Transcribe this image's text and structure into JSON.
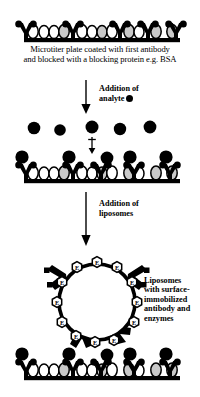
{
  "figure": {
    "panels": [
      {
        "id": "panel-1",
        "name": "antibody-coated-plate",
        "caption_line1": "Microtiter plate coated with first antibody",
        "caption_line2": "and blocked with a blocking protein e.g. BSA",
        "antibody_count": 5,
        "bsa_count": 12
      },
      {
        "id": "panel-2",
        "name": "analyte-bound-plate",
        "free_analyte_count": 5,
        "bound_analyte_count": 5,
        "antibody_count": 5,
        "bsa_count": 12
      },
      {
        "id": "panel-3",
        "name": "liposome-bound-plate",
        "enzyme_marker_label": "E",
        "enzyme_marker_count": 12,
        "liposome_antibody_count": 4,
        "antibody_count": 5,
        "bsa_count": 12
      }
    ],
    "arrows": [
      {
        "id": "arrow-1",
        "name": "addition-of-analyte-arrow",
        "label_line1": "Addition of",
        "label_line2": "analyte",
        "label_glyph": "filled-circle"
      },
      {
        "id": "arrow-2",
        "name": "addition-of-liposomes-arrow",
        "label_line1": "Addition of",
        "label_line2": "liposomes",
        "label_glyph": ""
      }
    ],
    "side_label": {
      "name": "liposome-description",
      "line1": "Liposomes",
      "line2": "with surface-",
      "line3": "immobilized",
      "line4": "antibody and",
      "line5": "enzymes"
    },
    "colors": {
      "ink": "#000000",
      "background": "#ffffff",
      "bsa_light": "#ffffff",
      "bsa_shaded": "#c9c9c9",
      "liposome_fill": "#ffffff"
    }
  }
}
